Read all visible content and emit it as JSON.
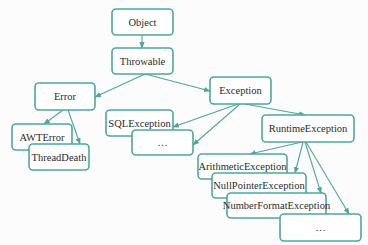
{
  "diagram": {
    "accent_color": "#4fa6a0",
    "nodes": [
      {
        "id": "object",
        "label": "Object"
      },
      {
        "id": "throwable",
        "label": "Throwable"
      },
      {
        "id": "error",
        "label": "Error"
      },
      {
        "id": "exception",
        "label": "Exception"
      },
      {
        "id": "awterror",
        "label": "AWTError"
      },
      {
        "id": "threaddeath",
        "label": "ThreadDeath"
      },
      {
        "id": "sqlexception",
        "label": "SQLException"
      },
      {
        "id": "exception-more",
        "label": "…"
      },
      {
        "id": "runtimeexception",
        "label": "RuntimeException"
      },
      {
        "id": "arithmeticexception",
        "label": "ArithmeticException"
      },
      {
        "id": "nullpointerexception",
        "label": "NullPointerException"
      },
      {
        "id": "numberformatexception",
        "label": "NumberFormatException"
      },
      {
        "id": "runtime-more",
        "label": "…"
      }
    ],
    "edges": [
      {
        "from": "object",
        "to": "throwable"
      },
      {
        "from": "throwable",
        "to": "error"
      },
      {
        "from": "throwable",
        "to": "exception"
      },
      {
        "from": "error",
        "to": "awterror"
      },
      {
        "from": "error",
        "to": "threaddeath"
      },
      {
        "from": "exception",
        "to": "sqlexception"
      },
      {
        "from": "exception",
        "to": "exception-more"
      },
      {
        "from": "exception",
        "to": "runtimeexception"
      },
      {
        "from": "runtimeexception",
        "to": "arithmeticexception"
      },
      {
        "from": "runtimeexception",
        "to": "nullpointerexception"
      },
      {
        "from": "runtimeexception",
        "to": "numberformatexception"
      },
      {
        "from": "runtimeexception",
        "to": "runtime-more"
      }
    ]
  }
}
